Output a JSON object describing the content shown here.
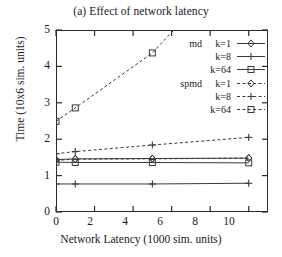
{
  "chart_data": {
    "type": "line",
    "title": "(a) Effect of network latency",
    "xlabel": "Network Latency (1000 sim. units)",
    "ylabel": "Time (10x6 sim. units)",
    "xlim": [
      0,
      11
    ],
    "ylim": [
      0,
      5
    ],
    "xticks": [
      "0",
      "2",
      "4",
      "6",
      "8",
      "10"
    ],
    "xtick_values": [
      0,
      2,
      4,
      6,
      8,
      10
    ],
    "yticks": [
      "0",
      "1",
      "2",
      "3",
      "4",
      "5"
    ],
    "ytick_values": [
      0,
      1,
      2,
      3,
      4,
      5
    ],
    "grid": false,
    "legend_position": "upper right",
    "x": [
      0,
      1,
      5,
      10
    ],
    "series": [
      {
        "name": "md k=1",
        "prefix": "md",
        "k": "k=1",
        "style": "solid",
        "marker": "diamond",
        "values": [
          1.44,
          1.46,
          1.47,
          1.48
        ]
      },
      {
        "name": "md k=8",
        "prefix": "",
        "k": "k=8",
        "style": "solid",
        "marker": "plus",
        "values": [
          0.77,
          0.77,
          0.77,
          0.79
        ]
      },
      {
        "name": "md k=64",
        "prefix": "",
        "k": "k=64",
        "style": "solid",
        "marker": "square",
        "values": [
          1.37,
          1.36,
          1.36,
          1.35
        ]
      },
      {
        "name": "spmd k=1",
        "prefix": "spmd",
        "k": "k=1",
        "style": "dashed",
        "marker": "diamond",
        "values": [
          1.42,
          1.45,
          1.46,
          1.48
        ]
      },
      {
        "name": "spmd k=8",
        "prefix": "",
        "k": "k=8",
        "style": "dashed",
        "marker": "plus",
        "values": [
          1.6,
          1.66,
          1.84,
          2.05
        ]
      },
      {
        "name": "spmd k=64",
        "prefix": "",
        "k": "k=64",
        "style": "dashed",
        "marker": "square",
        "values": [
          2.49,
          2.86,
          4.37,
          7.2
        ]
      }
    ],
    "colors": {
      "axis": "#2b2b2b",
      "line": "#3a3a3a",
      "background": "#ffffff"
    }
  }
}
